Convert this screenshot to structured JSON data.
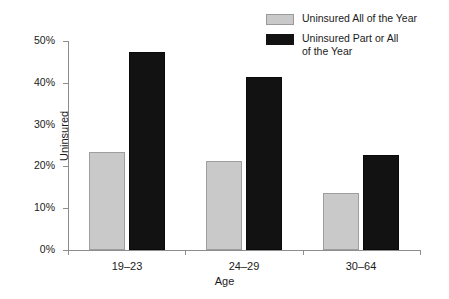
{
  "chart_data": {
    "type": "bar",
    "title": "",
    "subtitle": "",
    "xlabel": "Age",
    "ylabel": "Uninsured",
    "categories": [
      "19–23",
      "24–29",
      "30–64"
    ],
    "series": [
      {
        "name": "Uninsured All of the Year",
        "color": "#c9c9c9",
        "values": [
          23.4,
          21.3,
          13.6
        ]
      },
      {
        "name": "Uninsured Part or All of the Year",
        "color": "#121212",
        "values": [
          47.4,
          41.4,
          22.7
        ]
      }
    ],
    "ylim": [
      0,
      50
    ],
    "ytick_values": [
      0,
      10,
      20,
      30,
      40,
      50
    ],
    "ytick_labels": [
      "0%",
      "10%",
      "20%",
      "30%",
      "40%",
      "50%"
    ],
    "grid": false,
    "legend_position": "top-right",
    "legend_entries": [
      "Uninsured All of the Year",
      "Uninsured Part or All\nof the Year"
    ]
  }
}
